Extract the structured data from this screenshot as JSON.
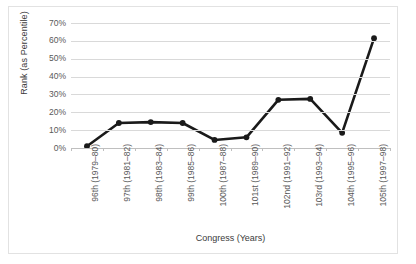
{
  "chart_data": {
    "type": "line",
    "title": "",
    "xlabel": "Congress (Years)",
    "ylabel": "Rank (as Percentile)",
    "categories": [
      "96th (1979–80)",
      "97th (1981–82)",
      "98th (1983–84)",
      "99th (1985–86)",
      "100th (1987–88)",
      "101st (1989–90)",
      "102nd (1991–92)",
      "103rd (1993–94)",
      "104th (1995–96)",
      "105th (1997–98)"
    ],
    "values": [
      1,
      14,
      14.5,
      14,
      4.5,
      6,
      27,
      27.5,
      8.5,
      61.5
    ],
    "ylim": [
      0,
      70
    ],
    "ytick_labels": [
      "70%",
      "60%",
      "50%",
      "40%",
      "30%",
      "20%",
      "10%",
      "0%"
    ],
    "ytick_values": [
      70,
      60,
      50,
      40,
      30,
      20,
      10,
      0
    ],
    "grid": "horizontal",
    "legend": "none",
    "series_color": "#1a1a1a",
    "gridline_color": "#d9d9d9",
    "marker": "circle"
  }
}
